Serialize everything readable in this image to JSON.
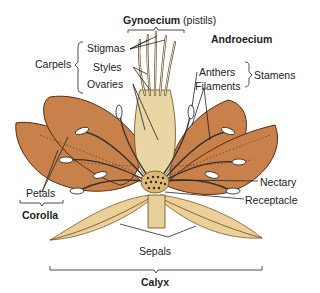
{
  "groups": {
    "gynoecium": "Gynoecium",
    "gynoecium_note": "(pistils)",
    "androecium": "Androecium",
    "carpels": "Carpels",
    "stamens": "Stamens",
    "corolla": "Corolla",
    "calyx": "Calyx"
  },
  "parts": {
    "stigmas": "Stigmas",
    "styles": "Styles",
    "ovaries": "Ovaries",
    "anthers": "Anthers",
    "filaments": "Filaments",
    "petals": "Petals",
    "nectary": "Nectary",
    "receptacle": "Receptacle",
    "sepals": "Sepals"
  },
  "colors": {
    "petal": "#c8814a",
    "petal_edge": "#5a2a10",
    "sepal": "#ecd09a",
    "pistil": "#e9d6a4",
    "stamen": "#ffffff",
    "nectary": "#d9b878",
    "line": "#222222"
  }
}
